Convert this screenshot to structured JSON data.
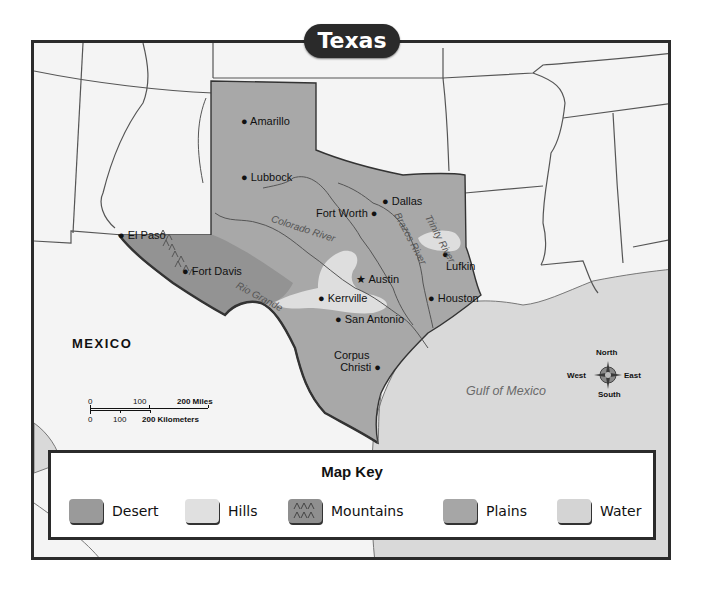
{
  "map": {
    "title": "Texas",
    "colors": {
      "desert": "#9d9d9d",
      "hills": "#dcdcdc",
      "mountains": "#8f8f8f",
      "plains": "#a9a9a9",
      "water": "#d6d6d6",
      "land_other": "#f4f4f4",
      "border": "#2b2b2b"
    },
    "cities": [
      {
        "name": "Amarillo"
      },
      {
        "name": "Lubbock"
      },
      {
        "name": "Dallas"
      },
      {
        "name": "Fort Worth"
      },
      {
        "name": "El Paso"
      },
      {
        "name": "Fort Davis"
      },
      {
        "name": "Austin",
        "capital": true
      },
      {
        "name": "Lufkin"
      },
      {
        "name": "Kerrville"
      },
      {
        "name": "Houston"
      },
      {
        "name": "San Antonio"
      },
      {
        "name": "Corpus",
        "line2": "Christi"
      }
    ],
    "rivers": [
      {
        "name": "Colorado River"
      },
      {
        "name": "Brazos River"
      },
      {
        "name": "Trinity River"
      },
      {
        "name": "Rio Grande"
      }
    ],
    "regions": {
      "country": "MEXICO",
      "water_body": "Gulf of Mexico"
    },
    "compass": {
      "north": "North",
      "south": "South",
      "east": "East",
      "west": "West"
    },
    "scale": {
      "miles": [
        "0",
        "100",
        "200 Miles"
      ],
      "kilometers": [
        "0",
        "100",
        "200 Kilometers"
      ]
    }
  },
  "legend": {
    "title": "Map Key",
    "items": [
      {
        "label": "Desert"
      },
      {
        "label": "Hills"
      },
      {
        "label": "Mountains"
      },
      {
        "label": "Plains"
      },
      {
        "label": "Water"
      }
    ]
  }
}
